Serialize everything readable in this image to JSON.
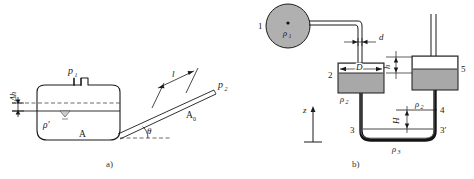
{
  "figure": {
    "caption_a": "a)",
    "caption_b": "b)"
  },
  "diagram_a": {
    "title": "inclined-tube-micromanometer",
    "labels": {
      "p1": "p",
      "p1_sub": "1",
      "p2": "p",
      "p2_sub": "2",
      "delta_h": "Δh",
      "rho_prime": "ρ′",
      "point_A": "A",
      "tube_length": "l",
      "area": "A",
      "area_sub": "0",
      "angle": "θ"
    }
  },
  "diagram_b": {
    "title": "two-vessel-differential-manometer",
    "labels": {
      "item_1": "1",
      "item_2": "2",
      "item_3": "3",
      "item_3p": "3′",
      "item_4": "4",
      "item_5": "5",
      "rho1": "ρ",
      "rho1_sub": "1",
      "rho2_left": "ρ",
      "rho2_left_sub": "2",
      "rho2_right": "ρ",
      "rho2_right_sub": "2",
      "rho3": "ρ",
      "rho3_sub": "3",
      "diam_d": "d",
      "diam_D": "D",
      "height_h": "h",
      "height_H": "H",
      "axis_z": "z"
    }
  },
  "colors": {
    "line": "#1a1a1a",
    "vessel_fill": "#a8a8a8",
    "circle_fill": "#b0b0b0",
    "white_band": "#ffffff",
    "tube_dark": "#141414",
    "dashed": "#444444",
    "background": "#ffffff"
  }
}
